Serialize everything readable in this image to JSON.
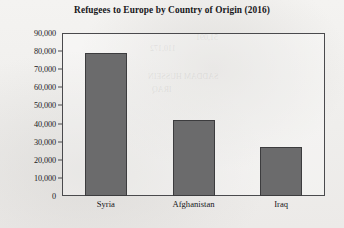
{
  "chart_data": {
    "type": "bar",
    "title": "Refugees to Europe by Country of Origin (2016)",
    "xlabel": "",
    "ylabel": "",
    "categories": [
      "Syria",
      "Afghanistan",
      "Iraq"
    ],
    "values": [
      79000,
      42000,
      27000
    ],
    "ylim": [
      0,
      90000
    ],
    "ytick_step": 10000,
    "ytick_labels": [
      "90,000",
      "80,000",
      "70,000",
      "60,000",
      "50,000",
      "40,000",
      "30,000",
      "20,000",
      "10,000",
      "0"
    ],
    "ytick_values": [
      90000,
      80000,
      70000,
      60000,
      50000,
      40000,
      30000,
      20000,
      10000,
      0
    ],
    "grid": false,
    "legend": null,
    "legend_position": "none",
    "series": [
      {
        "name": "Refugees",
        "values": [
          79000,
          42000,
          27000
        ]
      }
    ],
    "colors": {
      "bar_fill": "#6b6b6c",
      "bar_stroke": "#3c3c3e",
      "axis": "#4a4a4d",
      "text": "#17171a",
      "background": "#f2f1ef"
    }
  },
  "ghost": {
    "line1": "110,172",
    "line2": "51,091",
    "line3": "SADDAM HUSSEIN",
    "line4": "IRAQ"
  }
}
